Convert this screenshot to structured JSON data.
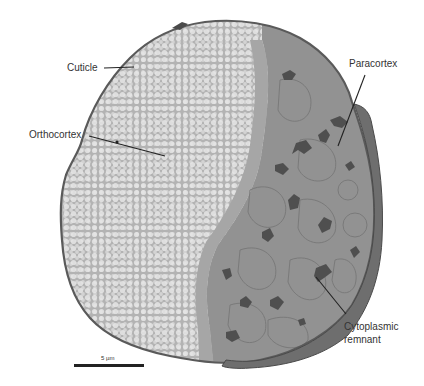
{
  "figure": {
    "labels": [
      {
        "id": "cuticle",
        "text": "Cuticle"
      },
      {
        "id": "orthocortex",
        "text": "Orthocortex"
      },
      {
        "id": "paracortex",
        "text": "Paracortex"
      },
      {
        "id": "cytoplasmic-remnant",
        "text": "Cytoplasmic remnant",
        "line1": "Cytoplasmic",
        "line2": "remnant"
      }
    ],
    "scale_bar": {
      "label": "5 µm"
    },
    "colors": {
      "background": "#ffffff",
      "orthocortex": "#c9c9c9",
      "paracortex": "#8f8f8f",
      "cuticle": "#5a5a5a",
      "remnant": "#4a4a4a",
      "label_text": "#333333"
    }
  }
}
